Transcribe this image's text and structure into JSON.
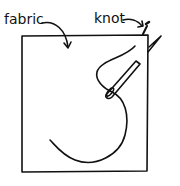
{
  "diagram": {
    "labels": {
      "fabric": "fabric",
      "knot": "knot"
    },
    "colors": {
      "ink": "#111111",
      "background": "#ffffff"
    },
    "elements": [
      "fabric-square",
      "thread",
      "needle",
      "knot"
    ]
  }
}
